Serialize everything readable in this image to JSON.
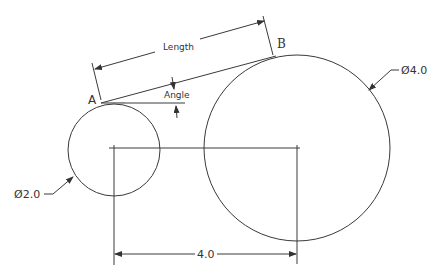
{
  "drawing": {
    "title": "Tangent line between two circles",
    "labels": {
      "point_a": "A",
      "point_b": "B",
      "length": "Length",
      "angle": "Angle",
      "small_diameter": "Ø2.0",
      "large_diameter": "Ø4.0",
      "center_distance": "4.0"
    },
    "small_circle": {
      "cx": 114,
      "cy": 150,
      "r": 46,
      "diameter": "2.0"
    },
    "large_circle": {
      "cx": 297,
      "cy": 148,
      "r": 93,
      "diameter": "4.0"
    },
    "colors": {
      "line": "#3a3a3a",
      "text": "#333333",
      "background": "#ffffff"
    }
  }
}
